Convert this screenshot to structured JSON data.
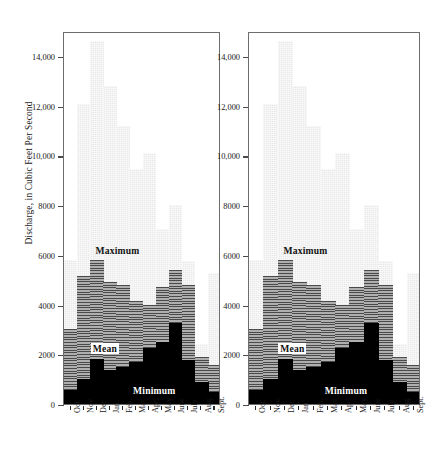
{
  "figure": {
    "axis_title_y": "Discharge, in Cubic Feet Per Second",
    "panel_count": 2,
    "series_labels": {
      "maximum": "Maximum",
      "mean": "Mean",
      "minimum": "Minimum"
    },
    "colors": {
      "maximum": "#e9e9e9",
      "mean": "#8c8c8c",
      "minimum": "#000000",
      "frame": "#6d6d6d",
      "text": "#1a1a1a"
    }
  },
  "chart_data": {
    "type": "bar",
    "title": "",
    "subtitle": "",
    "xlabel": "",
    "ylabel": "Discharge, in Cubic Feet Per Second",
    "ylim": [
      0,
      15000
    ],
    "yticks": [
      0,
      2000,
      4000,
      6000,
      8000,
      10000,
      12000,
      14000
    ],
    "ytick_labels": [
      "0",
      "2000",
      "4000",
      "6000",
      "8000",
      "10,000",
      "12,000",
      "14,000"
    ],
    "grid": false,
    "legend": "in-plot annotations",
    "categories": [
      "Oct.",
      "Nov.",
      "Dec.",
      "Jan.",
      "Feb.",
      "Mar.",
      "Apr.",
      "May",
      "June",
      "July",
      "Aug.",
      "Sept."
    ],
    "panels": [
      {
        "name": "left-panel",
        "series": [
          {
            "name": "Maximum",
            "values": [
              5800,
              12050,
              14600,
              12800,
              11200,
              9450,
              10100,
              7050,
              8000,
              5750,
              2400,
              5250
            ]
          },
          {
            "name": "Mean",
            "values": [
              3000,
              5150,
              5800,
              4900,
              4800,
              4150,
              4000,
              4700,
              5400,
              4800,
              1900,
              1550
            ]
          },
          {
            "name": "Minimum",
            "values": [
              550,
              1000,
              1820,
              1350,
              1500,
              1700,
              2250,
              2500,
              3250,
              1750,
              900,
              500
            ]
          }
        ]
      },
      {
        "name": "right-panel",
        "series": [
          {
            "name": "Maximum",
            "values": [
              5800,
              12050,
              14600,
              12800,
              11200,
              9450,
              10100,
              7050,
              8000,
              5750,
              2400,
              5250
            ]
          },
          {
            "name": "Mean",
            "values": [
              3000,
              5150,
              5800,
              4900,
              4800,
              4150,
              4000,
              4700,
              5400,
              4800,
              1900,
              1550
            ]
          },
          {
            "name": "Minimum",
            "values": [
              550,
              1000,
              1820,
              1350,
              1500,
              1700,
              2250,
              2500,
              3250,
              1750,
              900,
              500
            ]
          }
        ]
      }
    ]
  }
}
